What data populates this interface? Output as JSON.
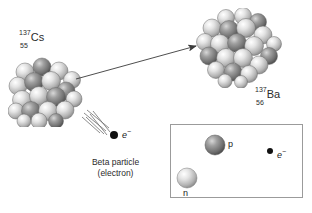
{
  "figure": {
    "background_color": "#ffffff"
  },
  "parent_nucleus": {
    "mass_number": "137",
    "symbol": "Cs",
    "atomic_number": "55",
    "name": "caesium-137-nucleus"
  },
  "daughter_nucleus": {
    "mass_number": "137",
    "symbol": "Ba",
    "atomic_number": "56",
    "name": "barium-137-nucleus"
  },
  "emitted_particle": {
    "symbol": "e",
    "charge": "−",
    "caption_line1": "Beta particle",
    "caption_line2": "(electron)"
  },
  "inset": {
    "neutron_label": "n",
    "proton_label": "p",
    "electron_symbol": "e",
    "electron_charge": "−"
  },
  "colors": {
    "nucleon_light": "#d9d9d9",
    "nucleon_dark": "#8a8a8a",
    "arrow": "#3a3a3a",
    "text": "#2b2b2b",
    "inset_border": "#9b9b9b",
    "electron_dot": "#111111"
  }
}
